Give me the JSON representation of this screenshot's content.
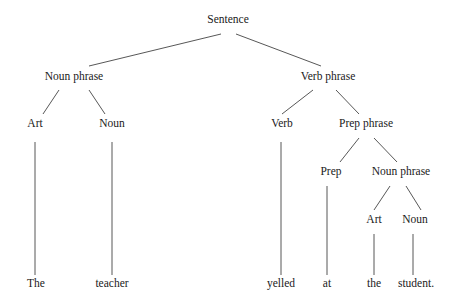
{
  "diagram": {
    "type": "parse-tree",
    "nodes": {
      "sentence": {
        "label": "Sentence",
        "x": 228,
        "y": 20
      },
      "np1": {
        "label": "Noun phrase",
        "x": 74,
        "y": 77
      },
      "vp": {
        "label": "Verb phrase",
        "x": 328,
        "y": 77
      },
      "art1": {
        "label": "Art",
        "x": 35,
        "y": 124
      },
      "noun1": {
        "label": "Noun",
        "x": 112,
        "y": 124
      },
      "verb": {
        "label": "Verb",
        "x": 282,
        "y": 124
      },
      "pp": {
        "label": "Prep phrase",
        "x": 366,
        "y": 124
      },
      "prep": {
        "label": "Prep",
        "x": 331,
        "y": 172
      },
      "np2": {
        "label": "Noun phrase",
        "x": 401,
        "y": 172
      },
      "art2": {
        "label": "Art",
        "x": 374,
        "y": 220
      },
      "noun2": {
        "label": "Noun",
        "x": 415,
        "y": 220
      },
      "w_the1": {
        "label": "The",
        "x": 36,
        "y": 284
      },
      "w_teacher": {
        "label": "teacher",
        "x": 112,
        "y": 284
      },
      "w_yelled": {
        "label": "yelled",
        "x": 281,
        "y": 284
      },
      "w_at": {
        "label": "at",
        "x": 327,
        "y": 284
      },
      "w_the2": {
        "label": "the",
        "x": 374,
        "y": 284
      },
      "w_student": {
        "label": "student.",
        "x": 416,
        "y": 284
      }
    },
    "edges": [
      [
        221,
        34,
        89,
        66
      ],
      [
        236,
        34,
        321,
        66
      ],
      [
        59,
        90,
        43,
        114
      ],
      [
        89,
        90,
        105,
        114
      ],
      [
        313,
        90,
        282,
        114
      ],
      [
        336,
        90,
        359,
        114
      ],
      [
        359,
        138,
        340,
        162
      ],
      [
        374,
        138,
        397,
        162
      ],
      [
        390,
        186,
        374,
        210
      ],
      [
        406,
        186,
        421,
        210
      ],
      [
        35,
        142,
        35,
        275
      ],
      [
        112,
        142,
        112,
        275
      ],
      [
        281,
        142,
        281,
        275
      ],
      [
        327,
        186,
        327,
        275
      ],
      [
        374,
        234,
        374,
        275
      ],
      [
        413,
        234,
        413,
        275
      ]
    ]
  }
}
